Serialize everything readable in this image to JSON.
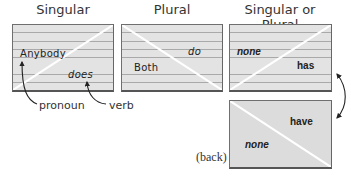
{
  "headings": {
    "singular": "Singular",
    "plural": "Plural",
    "singular_or_plural": "Singular or Plural"
  },
  "cards": {
    "singular": {
      "subject": "Anybody",
      "verb": "does"
    },
    "plural": {
      "subject": "Both",
      "verb": "do"
    },
    "either_front": {
      "subject": "none",
      "verb": "has"
    },
    "either_back": {
      "subject": "none",
      "verb": "have"
    }
  },
  "annotations": {
    "pronoun": "pronoun",
    "verb": "verb",
    "back": "(back)"
  },
  "colors": {
    "card_fill": "#e3e3e3",
    "card_lines": "#a9a9a9",
    "card_border": "#6f6f6f",
    "diagonal": "#ffffff",
    "text": "#222222"
  }
}
